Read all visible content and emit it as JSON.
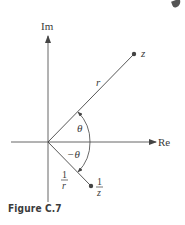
{
  "figure": {
    "caption": "Figure C.7",
    "axes": {
      "x_label": "Re",
      "y_label": "Im"
    },
    "points": [
      {
        "name": "z",
        "label": "z"
      },
      {
        "name": "reciprocal",
        "label_num": "1",
        "label_den": "z"
      }
    ],
    "labels": {
      "modulus": "r",
      "angle": "θ",
      "neg_angle": "−θ",
      "recip_mod_num": "1",
      "recip_mod_den": "r"
    },
    "colors": {
      "line": "#444444",
      "text": "#3a3a3a",
      "caption": "#3b3b3b"
    }
  }
}
